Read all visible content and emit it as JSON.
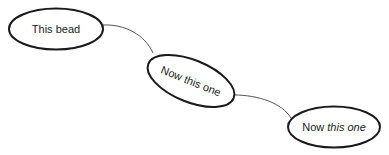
{
  "diagram": {
    "beads": [
      {
        "id": "bead-1",
        "label": "This bead"
      },
      {
        "id": "bead-2",
        "label": "Now this one"
      },
      {
        "id": "bead-3",
        "label_normal": "Now ",
        "label_italic": "this one"
      }
    ],
    "connectors": [
      {
        "from": "bead-1",
        "to": "bead-2"
      },
      {
        "from": "bead-2",
        "to": "bead-3"
      }
    ],
    "colors": {
      "outline": "#1a1a1a",
      "connector": "#555555",
      "text": "#222222",
      "background": "#ffffff"
    }
  }
}
